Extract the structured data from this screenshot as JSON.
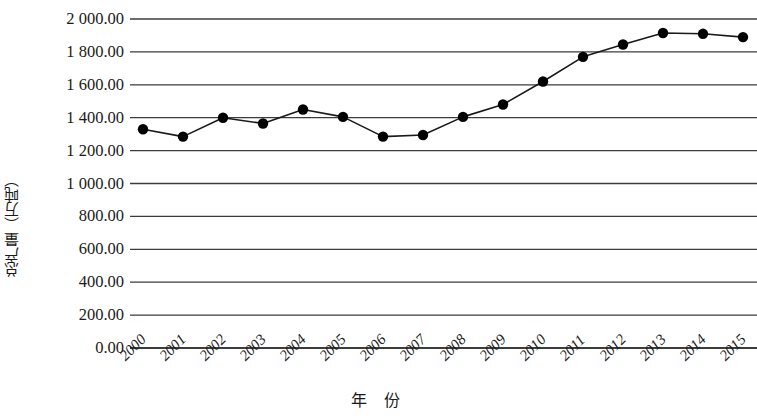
{
  "chart_data": {
    "type": "line",
    "title": "",
    "subtitle": "",
    "xlabel": "年 份",
    "ylabel": "总产量（万吨）",
    "categories": [
      "2000",
      "2001",
      "2002",
      "2003",
      "2004",
      "2005",
      "2006",
      "2007",
      "2008",
      "2009",
      "2010",
      "2011",
      "2012",
      "2013",
      "2014",
      "2015"
    ],
    "values": [
      1330,
      1285,
      1400,
      1365,
      1450,
      1405,
      1285,
      1295,
      1405,
      1480,
      1620,
      1770,
      1845,
      1915,
      1910,
      1890
    ],
    "series": [
      {
        "name": "总产量",
        "values": [
          1330,
          1285,
          1400,
          1365,
          1450,
          1405,
          1285,
          1295,
          1405,
          1480,
          1620,
          1770,
          1845,
          1915,
          1910,
          1890
        ]
      }
    ],
    "ylim": [
      0,
      2000
    ],
    "ytick_step": 200,
    "ytick_labels": [
      "2 000.00",
      "1 800.00",
      "1 600.00",
      "1 400.00",
      "1 200.00",
      "1 000.00",
      "800.00",
      "600.00",
      "400.00",
      "200.00",
      "0.00"
    ],
    "ytick_values": [
      2000,
      1800,
      1600,
      1400,
      1200,
      1000,
      800,
      600,
      400,
      200,
      0
    ],
    "grid": true,
    "grid_orientation": "horizontal",
    "legend": null,
    "legend_position": "none",
    "marker": "circle",
    "marker_color": "#000000",
    "line_color": "#1a1a1a",
    "grid_color": "#3c3c3c",
    "background_color": "#ffffff"
  }
}
